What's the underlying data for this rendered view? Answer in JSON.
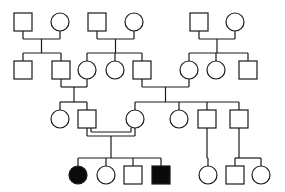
{
  "diagram": {
    "type": "pedigree",
    "colors": {
      "line": "#1a1a1a",
      "background": "#ffffff",
      "affected": "#0a0a0a",
      "unaffected": "#ffffff"
    },
    "symbol_size": 18,
    "individuals": [
      {
        "id": "I-1",
        "sex": "male",
        "affected": false,
        "x": 23,
        "y": 22
      },
      {
        "id": "I-2",
        "sex": "female",
        "affected": false,
        "x": 60,
        "y": 22
      },
      {
        "id": "I-3",
        "sex": "male",
        "affected": false,
        "x": 97,
        "y": 22
      },
      {
        "id": "I-4",
        "sex": "female",
        "affected": false,
        "x": 134,
        "y": 22
      },
      {
        "id": "I-5",
        "sex": "male",
        "affected": false,
        "x": 199,
        "y": 22
      },
      {
        "id": "I-6",
        "sex": "female",
        "affected": false,
        "x": 235,
        "y": 22
      },
      {
        "id": "II-1",
        "sex": "male",
        "affected": false,
        "x": 23,
        "y": 70
      },
      {
        "id": "II-2",
        "sex": "male",
        "affected": false,
        "x": 61,
        "y": 70
      },
      {
        "id": "II-3",
        "sex": "female",
        "affected": false,
        "x": 87,
        "y": 70
      },
      {
        "id": "II-4",
        "sex": "female",
        "affected": false,
        "x": 115,
        "y": 70
      },
      {
        "id": "II-5",
        "sex": "male",
        "affected": false,
        "x": 142,
        "y": 70
      },
      {
        "id": "II-6",
        "sex": "female",
        "affected": false,
        "x": 189,
        "y": 70
      },
      {
        "id": "II-7",
        "sex": "female",
        "affected": false,
        "x": 216,
        "y": 70
      },
      {
        "id": "II-8",
        "sex": "male",
        "affected": false,
        "x": 248,
        "y": 70
      },
      {
        "id": "III-1",
        "sex": "female",
        "affected": false,
        "x": 60,
        "y": 119
      },
      {
        "id": "III-2",
        "sex": "male",
        "affected": false,
        "x": 87,
        "y": 119
      },
      {
        "id": "III-3",
        "sex": "female",
        "affected": false,
        "x": 135,
        "y": 119
      },
      {
        "id": "III-4",
        "sex": "female",
        "affected": false,
        "x": 179,
        "y": 119
      },
      {
        "id": "III-5",
        "sex": "male",
        "affected": false,
        "x": 207,
        "y": 119
      },
      {
        "id": "III-6",
        "sex": "male",
        "affected": false,
        "x": 239,
        "y": 119
      },
      {
        "id": "IV-1",
        "sex": "female",
        "affected": true,
        "x": 78,
        "y": 175
      },
      {
        "id": "IV-2",
        "sex": "female",
        "affected": false,
        "x": 106,
        "y": 175
      },
      {
        "id": "IV-3",
        "sex": "male",
        "affected": false,
        "x": 133,
        "y": 175
      },
      {
        "id": "IV-4",
        "sex": "male",
        "affected": true,
        "x": 161,
        "y": 175
      },
      {
        "id": "IV-5",
        "sex": "female",
        "affected": false,
        "x": 208,
        "y": 175
      },
      {
        "id": "IV-6",
        "sex": "male",
        "affected": false,
        "x": 235,
        "y": 175
      },
      {
        "id": "IV-7",
        "sex": "female",
        "affected": false,
        "x": 261,
        "y": 175
      }
    ],
    "matings": [
      {
        "partners": [
          "I-1",
          "I-2"
        ],
        "consanguineous": false
      },
      {
        "partners": [
          "I-3",
          "I-4"
        ],
        "consanguineous": false
      },
      {
        "partners": [
          "I-5",
          "I-6"
        ],
        "consanguineous": false
      },
      {
        "partners": [
          "II-2",
          "II-3"
        ],
        "consanguineous": false
      },
      {
        "partners": [
          "II-5",
          "II-6"
        ],
        "consanguineous": false
      },
      {
        "partners": [
          "III-2",
          "III-3"
        ],
        "consanguineous": true
      }
    ],
    "children": [
      {
        "parents": [
          "I-1",
          "I-2"
        ],
        "offspring": [
          "II-1",
          "II-2"
        ]
      },
      {
        "parents": [
          "I-3",
          "I-4"
        ],
        "offspring": [
          "II-3",
          "II-4",
          "II-5"
        ]
      },
      {
        "parents": [
          "I-5",
          "I-6"
        ],
        "offspring": [
          "II-6",
          "II-7",
          "II-8"
        ]
      },
      {
        "parents": [
          "II-2",
          "II-3"
        ],
        "offspring": [
          "III-1",
          "III-2"
        ]
      },
      {
        "parents": [
          "II-5",
          "II-6"
        ],
        "offspring": [
          "III-3",
          "III-4",
          "III-5",
          "III-6"
        ]
      },
      {
        "parents": [
          "III-2",
          "III-3"
        ],
        "offspring": [
          "IV-1",
          "IV-2",
          "IV-3",
          "IV-4"
        ]
      },
      {
        "parents": [
          "III-5"
        ],
        "offspring": [
          "IV-5"
        ]
      },
      {
        "parents": [
          "III-6"
        ],
        "offspring": [
          "IV-6",
          "IV-7"
        ]
      }
    ]
  }
}
